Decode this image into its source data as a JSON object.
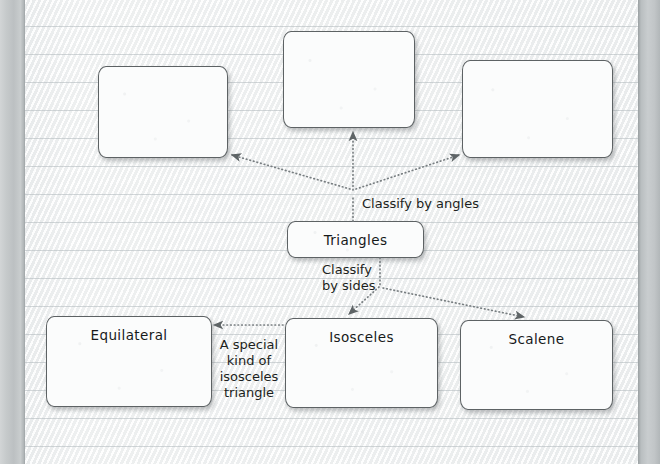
{
  "document": {
    "kind": "concept-map-worksheet",
    "subject": "Triangles"
  },
  "nodes": {
    "angle_box_1": {
      "label": "",
      "x": 98,
      "y": 66,
      "w": 130,
      "h": 92
    },
    "angle_box_2": {
      "label": "",
      "x": 283,
      "y": 31,
      "w": 132,
      "h": 97
    },
    "angle_box_3": {
      "label": "",
      "x": 462,
      "y": 60,
      "w": 151,
      "h": 98
    },
    "root": {
      "label": "Triangles",
      "x": 287,
      "y": 221,
      "w": 137,
      "h": 37
    },
    "equilateral": {
      "label": "Equilateral",
      "x": 46,
      "y": 316,
      "w": 166,
      "h": 91
    },
    "isosceles": {
      "label": "Isosceles",
      "x": 285,
      "y": 318,
      "w": 153,
      "h": 90
    },
    "scalene": {
      "label": "Scalene",
      "x": 460,
      "y": 320,
      "w": 153,
      "h": 90
    }
  },
  "edge_labels": {
    "classify_by_angles": "Classify by angles",
    "classify_by_sides": "Classify\nby sides",
    "special_kind": "A special\nkind of\nisosceles\ntriangle"
  },
  "colors": {
    "ink": "#171a1b",
    "box_border": "#5d6264",
    "box_fill": "#fbfcfc",
    "connector": "#6e7477",
    "paper": "#f4f5f5",
    "rule_line": "#b0b8bc",
    "gutter": "#c6cacb"
  }
}
